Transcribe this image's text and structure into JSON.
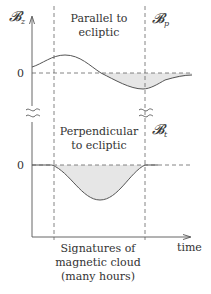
{
  "diagram": {
    "top_panel": {
      "y_label": "𝓑",
      "y_label_sub": "z",
      "title_line1": "Parallel to",
      "title_line2": "ecliptic",
      "right_label": "𝓑",
      "right_label_sub": "p",
      "zero_label": "0"
    },
    "bottom_panel": {
      "title_line1": "Perpendicular",
      "title_line2": "to ecliptic",
      "right_label": "𝓑",
      "right_label_sub": "t",
      "zero_label": "0"
    },
    "x_axis": {
      "label": "time"
    },
    "region_caption": {
      "line1": "Signatures of",
      "line2": "magnetic cloud",
      "line3": "(many hours)"
    },
    "colors": {
      "line": "#555555",
      "fill": "#e6e6e6",
      "text": "#333333"
    }
  }
}
